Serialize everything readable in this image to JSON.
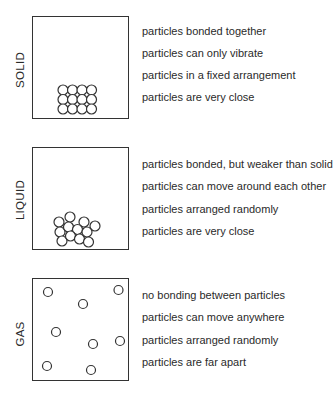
{
  "states": [
    {
      "label": "SOLID",
      "descriptions": [
        "particles bonded together",
        "particles can only vibrate",
        "particles in a fixed arrangement",
        "particles are very close"
      ]
    },
    {
      "label": "LIQUID",
      "descriptions": [
        "particles bonded, but weaker than solid",
        "particles can move around each other",
        "particles arranged randomly",
        "particles are very close"
      ]
    },
    {
      "label": "GAS",
      "descriptions": [
        "no bonding between particles",
        "particles can move anywhere",
        "particles arranged randomly",
        "particles are far apart"
      ]
    }
  ],
  "colors": {
    "stroke": "#333333",
    "text": "#2a2a2a",
    "background": "#ffffff"
  }
}
